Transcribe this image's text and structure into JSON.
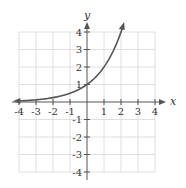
{
  "chart_data": {
    "type": "line",
    "title": "",
    "function": "y = 2^x",
    "xlabel": "x",
    "ylabel": "y",
    "xlim": [
      -4,
      4
    ],
    "ylim": [
      -4,
      4
    ],
    "grid": true,
    "x_ticks": [
      "-4",
      "-3",
      "-2",
      "-1",
      "1",
      "2",
      "3",
      "4"
    ],
    "y_ticks": [
      "4",
      "3",
      "2",
      "1",
      "-1",
      "-2",
      "-3",
      "-4"
    ],
    "series": [
      {
        "name": "curve",
        "x": [
          -4,
          -3,
          -2,
          -1,
          0,
          1,
          2,
          2.1
        ],
        "y": [
          0.0625,
          0.125,
          0.25,
          0.5,
          1,
          2,
          4,
          4.29
        ]
      }
    ],
    "color": "#555555"
  }
}
